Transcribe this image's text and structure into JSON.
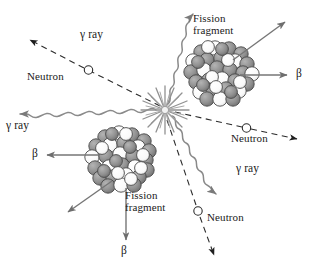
{
  "figure": {
    "name": "nuclear-fission-decay-diagram",
    "width": 314,
    "height": 267,
    "background": "#ffffff",
    "ink": "#1a1a1a",
    "line_gray": "#6e6e6e",
    "nucleon_gray": "#8c8c8c",
    "nucleon_white": "#ffffff",
    "burst_gray": "#9a9a9a"
  },
  "labels": {
    "fission_fragment_top": "Fission\nfragment",
    "fission_fragment_bottom": "Fission\nfragment",
    "gamma_top_left": "γ ray",
    "gamma_left": "γ ray",
    "gamma_right": "γ ray",
    "neutron_upper_left": "Neutron",
    "neutron_right": "Neutron",
    "neutron_bottom": "Neutron",
    "beta_right": "β",
    "beta_left": "β",
    "beta_bottom": "β"
  },
  "emissions": [
    {
      "id": "neutron-upper-left",
      "particle": "neutron",
      "label": "Neutron",
      "line_style": "dashed",
      "direction_deg": 215,
      "marker": "open-circle-and-arrow"
    },
    {
      "id": "neutron-right",
      "particle": "neutron",
      "label": "Neutron",
      "line_style": "dashed",
      "direction_deg": 15,
      "marker": "open-circle-and-arrow"
    },
    {
      "id": "neutron-bottom",
      "particle": "neutron",
      "label": "Neutron",
      "line_style": "dashed",
      "direction_deg": 105,
      "marker": "open-circle-and-arrow"
    },
    {
      "id": "gamma-top-right",
      "particle": "gamma",
      "label": "γ ray",
      "line_style": "wavy",
      "direction_deg": 305,
      "marker": "arrow"
    },
    {
      "id": "gamma-left",
      "particle": "gamma",
      "label": "γ ray",
      "line_style": "wavy",
      "direction_deg": 182,
      "marker": "arrow"
    },
    {
      "id": "gamma-bottom-right",
      "particle": "gamma",
      "label": "γ ray",
      "line_style": "wavy",
      "direction_deg": 40,
      "marker": "arrow"
    },
    {
      "id": "beta-top-fragment-right",
      "particle": "beta",
      "label": "β",
      "line_style": "solid",
      "direction_deg": 0,
      "marker": "arrow"
    },
    {
      "id": "beta-top-fragment-upright",
      "particle": "recoil",
      "label": "",
      "line_style": "solid",
      "direction_deg": 315,
      "marker": "arrow"
    },
    {
      "id": "beta-bottom-fragment-left",
      "particle": "beta",
      "label": "β",
      "line_style": "solid",
      "direction_deg": 180,
      "marker": "arrow"
    },
    {
      "id": "beta-bottom-fragment-down",
      "particle": "beta",
      "label": "β",
      "line_style": "solid",
      "direction_deg": 90,
      "marker": "arrow"
    },
    {
      "id": "recoil-bottom-fragment-downleft",
      "particle": "recoil",
      "label": "",
      "line_style": "solid",
      "direction_deg": 135,
      "marker": "arrow"
    }
  ],
  "nuclei": [
    {
      "id": "fission-fragment-top",
      "label": "Fission fragment",
      "center_x": 222,
      "center_y": 73,
      "radius": 33,
      "nucleon_count": 38
    },
    {
      "id": "fission-fragment-bottom",
      "label": "Fission fragment",
      "center_x": 120,
      "center_y": 160,
      "radius": 33,
      "nucleon_count": 38
    }
  ],
  "fission_point": {
    "id": "fission-burst",
    "center_x": 165,
    "center_y": 110,
    "spikes": 16
  }
}
